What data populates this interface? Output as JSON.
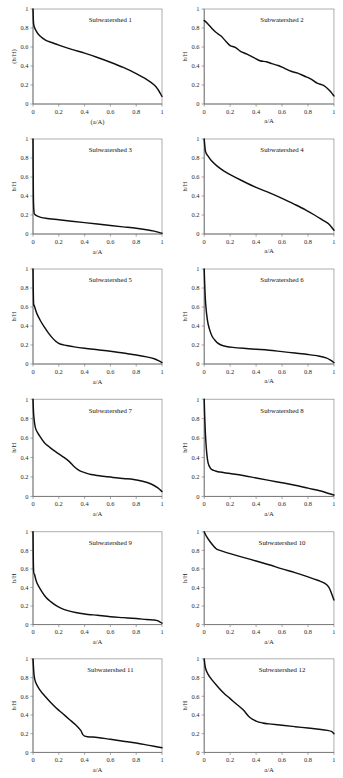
{
  "figure": {
    "type": "multi-panel-figure",
    "panel_count": 12,
    "columns": 2,
    "rows": 6,
    "background": "#ffffff",
    "line_color": "#101010",
    "axis_color": "#6f6f6f"
  },
  "chart_data": [
    {
      "type": "line",
      "title": "Subwatershed 1",
      "xlabel": "(a/A)",
      "ylabel": "(h/H)",
      "xlim": [
        0,
        1
      ],
      "ylim": [
        0,
        1
      ],
      "xticks": [
        0,
        0.2,
        0.4,
        0.6,
        0.8,
        1
      ],
      "yticks": [
        0,
        0.2,
        0.4,
        0.6,
        0.8,
        1
      ],
      "xticklabels": [
        "0",
        "0.2",
        "0.4",
        "0.6",
        "0.8",
        "1"
      ],
      "yticklabels": [
        "0",
        "0.2",
        "0.4",
        "0.6",
        "0.8",
        "1"
      ],
      "grid": false,
      "legend": "none",
      "x": [
        0,
        0.005,
        0.02,
        0.05,
        0.1,
        0.15,
        0.2,
        0.3,
        0.4,
        0.5,
        0.6,
        0.7,
        0.8,
        0.88,
        0.94,
        0.97,
        1
      ],
      "y": [
        1.0,
        0.84,
        0.78,
        0.72,
        0.67,
        0.645,
        0.62,
        0.575,
        0.535,
        0.49,
        0.44,
        0.385,
        0.32,
        0.26,
        0.2,
        0.15,
        0.08
      ]
    },
    {
      "type": "line",
      "title": "Subwatershed 2",
      "xlabel": "a/A",
      "ylabel": "h/H",
      "xlim": [
        0,
        1
      ],
      "ylim": [
        0,
        1
      ],
      "xticks": [
        0,
        0.2,
        0.4,
        0.6,
        0.8,
        1
      ],
      "yticks": [
        0,
        0.2,
        0.4,
        0.6,
        0.8,
        1
      ],
      "xticklabels": [
        "0",
        "0.2",
        "0.4",
        "0.6",
        "0.8",
        "1"
      ],
      "yticklabels": [
        "0",
        "0.2",
        "0.4",
        "0.6",
        "0.8",
        "1"
      ],
      "grid": false,
      "legend": "none",
      "x": [
        0,
        0.02,
        0.05,
        0.09,
        0.13,
        0.17,
        0.2,
        0.24,
        0.28,
        0.33,
        0.38,
        0.43,
        0.48,
        0.52,
        0.57,
        0.62,
        0.67,
        0.72,
        0.77,
        0.82,
        0.87,
        0.92,
        0.96,
        0.98,
        1
      ],
      "y": [
        0.88,
        0.855,
        0.81,
        0.755,
        0.715,
        0.655,
        0.615,
        0.595,
        0.555,
        0.525,
        0.49,
        0.455,
        0.445,
        0.425,
        0.405,
        0.375,
        0.345,
        0.325,
        0.295,
        0.265,
        0.22,
        0.195,
        0.15,
        0.12,
        0.085
      ]
    },
    {
      "type": "line",
      "title": "Subwatershed 3",
      "xlabel": "a/A",
      "ylabel": "h/H",
      "xlim": [
        0,
        1
      ],
      "ylim": [
        0,
        1
      ],
      "xticks": [
        0,
        0.2,
        0.4,
        0.6,
        0.8,
        1
      ],
      "yticks": [
        0,
        0.2,
        0.4,
        0.6,
        0.8,
        1
      ],
      "xticklabels": [
        "0",
        "0.2",
        "0.4",
        "0.6",
        "0.8",
        "1"
      ],
      "yticklabels": [
        "0",
        "0.2",
        "0.4",
        "0.6",
        "0.8",
        "1"
      ],
      "grid": false,
      "legend": "none",
      "x": [
        0,
        0.003,
        0.008,
        0.015,
        0.03,
        0.06,
        0.1,
        0.2,
        0.3,
        0.4,
        0.5,
        0.6,
        0.7,
        0.8,
        0.88,
        0.94,
        0.98,
        1
      ],
      "y": [
        1.0,
        0.4,
        0.23,
        0.205,
        0.19,
        0.175,
        0.165,
        0.15,
        0.135,
        0.12,
        0.105,
        0.09,
        0.075,
        0.06,
        0.045,
        0.03,
        0.015,
        0.008
      ]
    },
    {
      "type": "line",
      "title": "Subwatershed 4",
      "xlabel": "a/A",
      "ylabel": "h/H",
      "xlim": [
        0,
        1
      ],
      "ylim": [
        0,
        1
      ],
      "xticks": [
        0,
        0.2,
        0.4,
        0.6,
        0.8,
        1
      ],
      "yticks": [
        0,
        0.2,
        0.4,
        0.6,
        0.8,
        1
      ],
      "xticklabels": [
        "0",
        "0.2",
        "0.4",
        "0.6",
        "0.8",
        "1"
      ],
      "yticklabels": [
        "0",
        "0.2",
        "0.4",
        "0.6",
        "0.8",
        "1"
      ],
      "grid": false,
      "legend": "none",
      "x": [
        0,
        0.01,
        0.03,
        0.06,
        0.1,
        0.15,
        0.2,
        0.3,
        0.4,
        0.5,
        0.6,
        0.7,
        0.78,
        0.85,
        0.92,
        0.96,
        1
      ],
      "y": [
        1.0,
        0.87,
        0.82,
        0.765,
        0.715,
        0.665,
        0.625,
        0.555,
        0.49,
        0.435,
        0.375,
        0.31,
        0.255,
        0.2,
        0.14,
        0.105,
        0.04
      ]
    },
    {
      "type": "line",
      "title": "Subwatershed 5",
      "xlabel": "a/A",
      "ylabel": "h/H",
      "xlim": [
        0,
        1
      ],
      "ylim": [
        0,
        1
      ],
      "xticks": [
        0,
        0.2,
        0.4,
        0.6,
        0.8,
        1
      ],
      "yticks": [
        0,
        0.2,
        0.4,
        0.6,
        0.8,
        1
      ],
      "xticklabels": [
        "0",
        "0.2",
        "0.4",
        "0.6",
        "0.8",
        "1"
      ],
      "yticklabels": [
        "0",
        "0.2",
        "0.4",
        "0.6",
        "0.8",
        "1"
      ],
      "grid": false,
      "legend": "none",
      "x": [
        0,
        0.004,
        0.01,
        0.03,
        0.06,
        0.09,
        0.12,
        0.15,
        0.18,
        0.21,
        0.26,
        0.32,
        0.4,
        0.5,
        0.6,
        0.7,
        0.8,
        0.88,
        0.94,
        0.98,
        1
      ],
      "y": [
        1.0,
        0.65,
        0.615,
        0.53,
        0.45,
        0.385,
        0.325,
        0.275,
        0.235,
        0.21,
        0.195,
        0.18,
        0.165,
        0.15,
        0.135,
        0.115,
        0.095,
        0.075,
        0.055,
        0.03,
        0.015
      ]
    },
    {
      "type": "line",
      "title": "Subwatershed 6",
      "xlabel": "a/A",
      "ylabel": "h/H",
      "xlim": [
        0,
        1
      ],
      "ylim": [
        0,
        1
      ],
      "xticks": [
        0,
        0.2,
        0.4,
        0.6,
        0.8,
        1
      ],
      "yticks": [
        0,
        0.2,
        0.4,
        0.6,
        0.8,
        1
      ],
      "xticklabels": [
        "0",
        "0.2",
        "0.4",
        "0.6",
        "0.8",
        "1"
      ],
      "yticklabels": [
        "0",
        "0.2",
        "0.4",
        "0.6",
        "0.8",
        "1"
      ],
      "grid": false,
      "legend": "none",
      "x": [
        0,
        0.005,
        0.012,
        0.025,
        0.04,
        0.06,
        0.08,
        0.1,
        0.13,
        0.17,
        0.22,
        0.3,
        0.4,
        0.5,
        0.6,
        0.7,
        0.8,
        0.88,
        0.94,
        0.98,
        1
      ],
      "y": [
        1.0,
        0.8,
        0.62,
        0.46,
        0.37,
        0.295,
        0.255,
        0.225,
        0.2,
        0.185,
        0.175,
        0.165,
        0.155,
        0.145,
        0.13,
        0.115,
        0.1,
        0.085,
        0.065,
        0.035,
        0.015
      ]
    },
    {
      "type": "line",
      "title": "Subwatershed 7",
      "xlabel": "a/A",
      "ylabel": "h/H",
      "xlim": [
        0,
        1
      ],
      "ylim": [
        0,
        1
      ],
      "xticks": [
        0,
        0.2,
        0.4,
        0.6,
        0.8,
        1
      ],
      "yticks": [
        0,
        0.2,
        0.4,
        0.6,
        0.8,
        1
      ],
      "xticklabels": [
        "0",
        "0.2",
        "0.4",
        "0.6",
        "0.8",
        "1"
      ],
      "yticklabels": [
        "0",
        "0.2",
        "0.4",
        "0.6",
        "0.8",
        "1"
      ],
      "grid": false,
      "legend": "none",
      "x": [
        0,
        0.006,
        0.02,
        0.05,
        0.09,
        0.13,
        0.18,
        0.23,
        0.28,
        0.32,
        0.36,
        0.4,
        0.45,
        0.5,
        0.56,
        0.62,
        0.7,
        0.78,
        0.85,
        0.92,
        0.97,
        1
      ],
      "y": [
        1.0,
        0.83,
        0.7,
        0.625,
        0.55,
        0.505,
        0.455,
        0.41,
        0.36,
        0.305,
        0.265,
        0.245,
        0.225,
        0.215,
        0.205,
        0.195,
        0.185,
        0.175,
        0.155,
        0.125,
        0.085,
        0.05
      ]
    },
    {
      "type": "line",
      "title": "Subwatershed 8",
      "xlabel": "a/A",
      "ylabel": "h/H",
      "xlim": [
        0,
        1
      ],
      "ylim": [
        0,
        1
      ],
      "xticks": [
        0,
        0.2,
        0.4,
        0.6,
        0.8,
        1
      ],
      "yticks": [
        0,
        0.2,
        0.4,
        0.6,
        0.8,
        1
      ],
      "xticklabels": [
        "0",
        "0.2",
        "0.4",
        "0.6",
        "0.8",
        "1"
      ],
      "yticklabels": [
        "0",
        "0.2",
        "0.4",
        "0.6",
        "0.8",
        "1"
      ],
      "grid": false,
      "legend": "none",
      "x": [
        0,
        0.004,
        0.01,
        0.02,
        0.03,
        0.045,
        0.06,
        0.08,
        0.12,
        0.2,
        0.3,
        0.4,
        0.5,
        0.6,
        0.7,
        0.8,
        0.9,
        0.96,
        1
      ],
      "y": [
        1.0,
        0.82,
        0.63,
        0.44,
        0.345,
        0.295,
        0.275,
        0.265,
        0.25,
        0.235,
        0.215,
        0.19,
        0.165,
        0.14,
        0.115,
        0.085,
        0.055,
        0.03,
        0.015
      ]
    },
    {
      "type": "line",
      "title": "Subwatershed 9",
      "xlabel": "a/A",
      "ylabel": "h/H",
      "xlim": [
        0,
        1
      ],
      "ylim": [
        0,
        1
      ],
      "xticks": [
        0,
        0.2,
        0.4,
        0.6,
        0.8,
        1
      ],
      "yticks": [
        0,
        0.2,
        0.4,
        0.6,
        0.8,
        1
      ],
      "xticklabels": [
        "0",
        "0.2",
        "0.4",
        "0.6",
        "0.8",
        "1"
      ],
      "yticklabels": [
        "0",
        "0.2",
        "0.4",
        "0.6",
        "0.8",
        "1"
      ],
      "grid": false,
      "legend": "none",
      "x": [
        0,
        0.004,
        0.012,
        0.03,
        0.06,
        0.1,
        0.14,
        0.18,
        0.22,
        0.27,
        0.33,
        0.4,
        0.5,
        0.6,
        0.7,
        0.8,
        0.88,
        0.94,
        0.97,
        1
      ],
      "y": [
        1.0,
        0.6,
        0.54,
        0.45,
        0.375,
        0.295,
        0.245,
        0.205,
        0.175,
        0.15,
        0.13,
        0.115,
        0.1,
        0.085,
        0.075,
        0.065,
        0.055,
        0.05,
        0.04,
        0.015
      ]
    },
    {
      "type": "line",
      "title": "Subwatershed 10",
      "xlabel": "a/A",
      "ylabel": "h/H",
      "xlim": [
        0,
        1
      ],
      "ylim": [
        0,
        1
      ],
      "xticks": [
        0,
        0.2,
        0.4,
        0.6,
        0.8,
        1
      ],
      "yticks": [
        0,
        0.2,
        0.4,
        0.6,
        0.8,
        1
      ],
      "xticklabels": [
        "0",
        "0.2",
        "0.4",
        "0.6",
        "0.8",
        "1"
      ],
      "yticklabels": [
        "0",
        "0.2",
        "0.4",
        "0.6",
        "0.8",
        "1"
      ],
      "grid": false,
      "legend": "none",
      "x": [
        0,
        0.02,
        0.05,
        0.09,
        0.12,
        0.2,
        0.3,
        0.4,
        0.5,
        0.6,
        0.7,
        0.8,
        0.88,
        0.93,
        0.96,
        0.98,
        1
      ],
      "y": [
        1.0,
        0.945,
        0.885,
        0.82,
        0.8,
        0.765,
        0.725,
        0.685,
        0.645,
        0.6,
        0.56,
        0.515,
        0.475,
        0.445,
        0.405,
        0.34,
        0.265
      ]
    },
    {
      "type": "line",
      "title": "Subwatershed 11",
      "xlabel": "a/A",
      "ylabel": "h/H",
      "xlim": [
        0,
        1
      ],
      "ylim": [
        0,
        1
      ],
      "xticks": [
        0,
        0.2,
        0.4,
        0.6,
        0.8,
        1
      ],
      "yticks": [
        0,
        0.2,
        0.4,
        0.6,
        0.8,
        1
      ],
      "xticklabels": [
        "0",
        "0.2",
        "0.4",
        "0.6",
        "0.8",
        "1"
      ],
      "yticklabels": [
        "0",
        "0.2",
        "0.4",
        "0.6",
        "0.8",
        "1"
      ],
      "grid": false,
      "legend": "none",
      "x": [
        0,
        0.008,
        0.02,
        0.05,
        0.09,
        0.13,
        0.18,
        0.23,
        0.28,
        0.33,
        0.37,
        0.4,
        0.5,
        0.6,
        0.7,
        0.8,
        0.9,
        1
      ],
      "y": [
        1.0,
        0.83,
        0.75,
        0.675,
        0.605,
        0.545,
        0.475,
        0.415,
        0.355,
        0.295,
        0.235,
        0.175,
        0.16,
        0.14,
        0.12,
        0.1,
        0.075,
        0.05
      ]
    },
    {
      "type": "line",
      "title": "Subwatershed 12",
      "xlabel": "a/A",
      "ylabel": "h/H",
      "xlim": [
        0,
        1
      ],
      "ylim": [
        0,
        1
      ],
      "xticks": [
        0,
        0.2,
        0.4,
        0.6,
        0.8,
        1
      ],
      "yticks": [
        0,
        0.2,
        0.4,
        0.6,
        0.8,
        1
      ],
      "xticklabels": [
        "0",
        "0.2",
        "0.4",
        "0.6",
        "0.8",
        "1"
      ],
      "yticklabels": [
        "0",
        "0.2",
        "0.4",
        "0.6",
        "0.8",
        "1"
      ],
      "grid": false,
      "legend": "none",
      "x": [
        0,
        0.01,
        0.03,
        0.06,
        0.1,
        0.15,
        0.2,
        0.25,
        0.3,
        0.35,
        0.4,
        0.45,
        0.5,
        0.6,
        0.7,
        0.8,
        0.9,
        0.95,
        0.98,
        1
      ],
      "y": [
        1.0,
        0.9,
        0.835,
        0.775,
        0.71,
        0.635,
        0.575,
        0.515,
        0.455,
        0.375,
        0.335,
        0.315,
        0.305,
        0.29,
        0.275,
        0.26,
        0.245,
        0.235,
        0.225,
        0.2
      ]
    }
  ]
}
